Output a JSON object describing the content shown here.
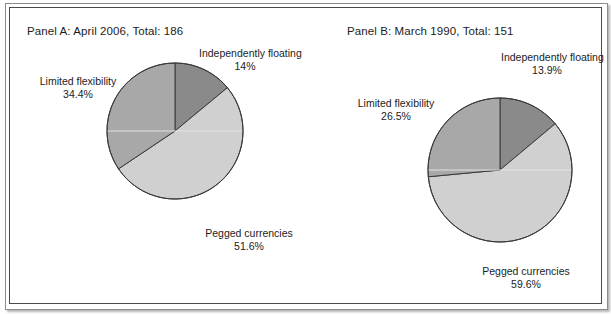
{
  "figure": {
    "background": "#ffffff",
    "border_color": "#4a4a4a"
  },
  "panels": [
    {
      "id": "panel-a",
      "title": "Panel A: April 2006, Total: 186",
      "labels": {
        "floating_name": "Independently floating",
        "floating_pct": "14%",
        "limited_name": "Limited flexibility",
        "limited_pct": "34.4%",
        "pegged_name": "Pegged currencies",
        "pegged_pct": "51.6%"
      }
    },
    {
      "id": "panel-b",
      "title": "Panel B: March 1990, Total: 151",
      "labels": {
        "floating_name": "Independently floating",
        "floating_pct": "13.9%",
        "limited_name": "Limited flexibility",
        "limited_pct": "26.5%",
        "pegged_name": "Pegged currencies",
        "pegged_pct": "59.6%"
      }
    }
  ],
  "colors": {
    "independently_floating": "#8a8a8a",
    "pegged_currencies": "#d0d0d0",
    "limited_flexibility": "#a8a8a8",
    "slice_outline": "#3a3a3a",
    "gridline": "#e2e2e2",
    "text": "#1c1c1c"
  },
  "chart_data": [
    {
      "type": "pie",
      "title": "Panel A: April 2006, Total: 186",
      "total": 186,
      "period": "April 2006",
      "categories": [
        "Independently floating",
        "Pegged currencies",
        "Limited flexibility"
      ],
      "values": [
        14,
        51.6,
        34.4
      ],
      "value_unit": "percent",
      "labels": [
        "14%",
        "51.6%",
        "34.4%"
      ],
      "colors": [
        "#8a8a8a",
        "#d0d0d0",
        "#a8a8a8"
      ],
      "start_angle_deg": 0,
      "direction": "clockwise",
      "legend": "none",
      "grid": "single horizontal line through center"
    },
    {
      "type": "pie",
      "title": "Panel B: March 1990, Total: 151",
      "total": 151,
      "period": "March 1990",
      "categories": [
        "Independently floating",
        "Pegged currencies",
        "Limited flexibility"
      ],
      "values": [
        13.9,
        59.6,
        26.5
      ],
      "value_unit": "percent",
      "labels": [
        "13.9%",
        "59.6%",
        "26.5%"
      ],
      "colors": [
        "#8a8a8a",
        "#d0d0d0",
        "#a8a8a8"
      ],
      "start_angle_deg": 0,
      "direction": "clockwise",
      "legend": "none",
      "grid": "single horizontal line through center"
    }
  ]
}
